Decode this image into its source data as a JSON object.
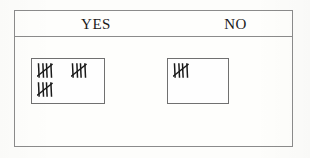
{
  "figure": {
    "type": "tally-chart",
    "columns": [
      {
        "id": "yes",
        "label": "YES",
        "tally_total": 15,
        "tally_groups": [
          5,
          5,
          5
        ],
        "group_rows": [
          [
            5,
            5
          ],
          [
            5
          ]
        ]
      },
      {
        "id": "no",
        "label": "NO",
        "tally_total": 5,
        "tally_groups": [
          5
        ],
        "group_rows": [
          [
            5
          ]
        ]
      }
    ]
  },
  "colors": {
    "frame_border": "#8b8b8b",
    "box_border": "#707070",
    "ink": "#1a1a1a",
    "paper": "#fdfdfb"
  }
}
